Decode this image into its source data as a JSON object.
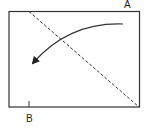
{
  "diagram": {
    "labels": {
      "corner_a": "A",
      "point_b": "B"
    },
    "elements": {
      "rectangle": "frame",
      "diagonal": "dashed line from top edge to bottom-right corner A",
      "arrow": "curved arrow sweeping from right to lower-left"
    },
    "colors": {
      "stroke": "#333333",
      "background": "#ffffff"
    }
  }
}
